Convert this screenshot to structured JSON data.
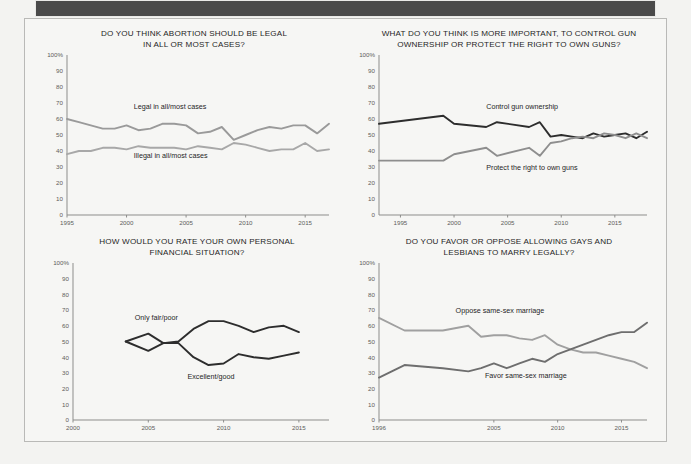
{
  "page": {
    "background_color": "#f3f3f1",
    "banner_color": "#4a4a4a",
    "frame_border_color": "#b9b9b7",
    "ghost_text": ""
  },
  "palette": {
    "dark_line": "#2d2d2d",
    "mid_line": "#6e6e6e",
    "light_line": "#a8a8a8",
    "axis": "#8d8d8b",
    "tick_text": "#5d5d5b",
    "title_text": "#1f1f1f"
  },
  "chart_data": [
    {
      "id": "abortion",
      "type": "line",
      "title": "DO YOU THINK ABORTION SHOULD BE LEGAL\nIN ALL OR MOST CASES?",
      "xlabel": "",
      "ylabel": "",
      "ylim": [
        0,
        100
      ],
      "yticks": [
        "100%",
        "90",
        "80",
        "70",
        "60",
        "50",
        "40",
        "30",
        "20",
        "10",
        "0"
      ],
      "ytick_values": [
        100,
        90,
        80,
        70,
        60,
        50,
        40,
        30,
        20,
        10,
        0
      ],
      "xlim": [
        1995,
        2017
      ],
      "xticks": [
        "1995",
        "2000",
        "2005",
        "2010",
        "2015"
      ],
      "xtick_values": [
        1995,
        2000,
        2005,
        2010,
        2015
      ],
      "grid": false,
      "legend_position": "inline-annotation",
      "series": [
        {
          "name": "Legal in all/most cases",
          "color": "#9a9a9a",
          "label_x": 2000.6,
          "label_y": 66,
          "x": [
            1995,
            1996,
            1997,
            1998,
            1999,
            2000,
            2001,
            2002,
            2003,
            2004,
            2005,
            2006,
            2007,
            2008,
            2009,
            2010,
            2011,
            2012,
            2013,
            2014,
            2015,
            2016,
            2017
          ],
          "values": [
            60,
            58,
            56,
            54,
            54,
            56,
            53,
            54,
            57,
            57,
            56,
            51,
            52,
            55,
            47,
            50,
            53,
            55,
            54,
            56,
            56,
            51,
            57
          ]
        },
        {
          "name": "Illegal in all/most cases",
          "color": "#a8a8a8",
          "label_x": 2000.6,
          "label_y": 35.5,
          "x": [
            1995,
            1996,
            1997,
            1998,
            1999,
            2000,
            2001,
            2002,
            2003,
            2004,
            2005,
            2006,
            2007,
            2008,
            2009,
            2010,
            2011,
            2012,
            2013,
            2014,
            2015,
            2016,
            2017
          ],
          "values": [
            38,
            40,
            40,
            42,
            42,
            41,
            43,
            42,
            42,
            42,
            41,
            43,
            42,
            41,
            45,
            44,
            42,
            40,
            41,
            41,
            45,
            40,
            41
          ]
        }
      ]
    },
    {
      "id": "guns",
      "type": "line",
      "title": "WHAT DO YOU THINK IS MORE IMPORTANT, TO CONTROL GUN\nOWNERSHIP OR PROTECT THE RIGHT TO OWN GUNS?",
      "xlabel": "",
      "ylabel": "",
      "ylim": [
        0,
        100
      ],
      "yticks": [
        "100%",
        "90",
        "80",
        "70",
        "60",
        "50",
        "40",
        "30",
        "20",
        "10",
        "0"
      ],
      "ytick_values": [
        100,
        90,
        80,
        70,
        60,
        50,
        40,
        30,
        20,
        10,
        0
      ],
      "xlim": [
        1993,
        2018
      ],
      "xticks": [
        "1995",
        "2000",
        "2005",
        "2010",
        "2015"
      ],
      "xtick_values": [
        1995,
        2000,
        2005,
        2010,
        2015
      ],
      "grid": false,
      "legend_position": "inline-annotation",
      "series": [
        {
          "name": "Control gun ownership",
          "color": "#2d2d2d",
          "label_x": 2003.0,
          "label_y": 66,
          "x": [
            1993,
            1999,
            2000,
            2003,
            2004,
            2007,
            2008,
            2009,
            2010,
            2011,
            2012,
            2013,
            2014,
            2015,
            2016,
            2017,
            2018
          ],
          "values": [
            57,
            62,
            57,
            55,
            58,
            55,
            58,
            49,
            50,
            49,
            48,
            51,
            49,
            50,
            51,
            48,
            52
          ]
        },
        {
          "name": "Protect the right to own guns",
          "color": "#8e8e8e",
          "label_x": 2003.0,
          "label_y": 28,
          "x": [
            1993,
            1999,
            2000,
            2003,
            2004,
            2007,
            2008,
            2009,
            2010,
            2011,
            2012,
            2013,
            2014,
            2015,
            2016,
            2017,
            2018
          ],
          "values": [
            34,
            34,
            38,
            42,
            37,
            42,
            37,
            45,
            46,
            48,
            49,
            48,
            51,
            50,
            48,
            51,
            48
          ]
        }
      ]
    },
    {
      "id": "finances",
      "type": "line",
      "title": "HOW WOULD YOU RATE YOUR OWN PERSONAL\nFINANCIAL SITUATION?",
      "xlabel": "",
      "ylabel": "",
      "ylim": [
        0,
        100
      ],
      "yticks": [
        "100%",
        "90",
        "80",
        "70",
        "60",
        "50",
        "40",
        "30",
        "20",
        "10",
        "0"
      ],
      "ytick_values": [
        100,
        90,
        80,
        70,
        60,
        50,
        40,
        30,
        20,
        10,
        0
      ],
      "xlim": [
        2000,
        2017
      ],
      "xticks": [
        "2000",
        "2005",
        "2010",
        "2015"
      ],
      "xtick_values": [
        2000,
        2005,
        2010,
        2015
      ],
      "grid": false,
      "legend_position": "inline-annotation",
      "series": [
        {
          "name": "Only fair/poor",
          "color": "#2d2d2d",
          "label_x": 2004.1,
          "label_y": 64,
          "x": [
            2003.5,
            2005,
            2006,
            2007,
            2008,
            2009,
            2010,
            2011,
            2012,
            2013,
            2014,
            2015
          ],
          "values": [
            50,
            55,
            49,
            50,
            58,
            63,
            63,
            60,
            56,
            59,
            60,
            56
          ]
        },
        {
          "name": "Excellent/good",
          "color": "#2d2d2d",
          "label_x": 2007.6,
          "label_y": 26,
          "x": [
            2003.5,
            2005,
            2006,
            2007,
            2008,
            2009,
            2010,
            2011,
            2012,
            2013,
            2014,
            2015
          ],
          "values": [
            50,
            44,
            49,
            49,
            40,
            35,
            36,
            42,
            40,
            39,
            41,
            43
          ]
        }
      ]
    },
    {
      "id": "marriage",
      "type": "line",
      "title": "DO YOU FAVOR OR OPPOSE ALLOWING GAYS AND\nLESBIANS TO MARRY LEGALLY?",
      "xlabel": "",
      "ylabel": "",
      "ylim": [
        0,
        100
      ],
      "yticks": [
        "100%",
        "90",
        "80",
        "70",
        "60",
        "50",
        "40",
        "30",
        "20",
        "10",
        "0"
      ],
      "ytick_values": [
        100,
        90,
        80,
        70,
        60,
        50,
        40,
        30,
        20,
        10,
        0
      ],
      "xlim": [
        1996,
        2017
      ],
      "xticks": [
        "1996",
        "2005",
        "2010",
        "2015"
      ],
      "xtick_values": [
        1996,
        2005,
        2010,
        2015
      ],
      "grid": false,
      "legend_position": "inline-annotation",
      "series": [
        {
          "name": "Oppose same-sex marriage",
          "color": "#a0a0a0",
          "label_x": 2002.0,
          "label_y": 68,
          "x": [
            1996,
            1998,
            2001,
            2003,
            2004,
            2005,
            2006,
            2007,
            2008,
            2009,
            2010,
            2011,
            2012,
            2013,
            2014,
            2015,
            2016,
            2017
          ],
          "values": [
            65,
            57,
            57,
            60,
            53,
            54,
            54,
            52,
            51,
            54,
            48,
            45,
            43,
            43,
            41,
            39,
            37,
            33
          ]
        },
        {
          "name": "Favor same-sex marriage",
          "color": "#6e6e6e",
          "label_x": 2004.3,
          "label_y": 27,
          "x": [
            1996,
            1998,
            2001,
            2003,
            2004,
            2005,
            2006,
            2007,
            2008,
            2009,
            2010,
            2011,
            2012,
            2013,
            2014,
            2015,
            2016,
            2017
          ],
          "values": [
            27,
            35,
            33,
            31,
            33,
            36,
            33,
            36,
            39,
            37,
            42,
            45,
            48,
            51,
            54,
            56,
            56,
            62
          ]
        }
      ]
    }
  ]
}
